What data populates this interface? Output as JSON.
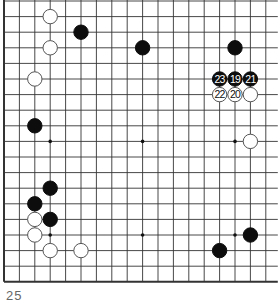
{
  "diagram": {
    "type": "go-board-fragment",
    "caption": "25",
    "grid": {
      "origin_x": 4,
      "origin_y": 1,
      "spacing_x": 15.4,
      "spacing_y": 15.6,
      "cols_visible": 18,
      "rows_visible": 19,
      "left_edge": true,
      "bottom_edge": true,
      "line_color": "#333333"
    },
    "star_points": [
      [
        3,
        3
      ],
      [
        9,
        3
      ],
      [
        15,
        3
      ],
      [
        3,
        9
      ],
      [
        9,
        9
      ],
      [
        15,
        9
      ],
      [
        3,
        15
      ],
      [
        9,
        15
      ],
      [
        15,
        15
      ]
    ],
    "stones": [
      {
        "color": "white",
        "col": 3,
        "row": 1,
        "label": ""
      },
      {
        "color": "black",
        "col": 5,
        "row": 2,
        "label": ""
      },
      {
        "color": "white",
        "col": 3,
        "row": 3,
        "label": ""
      },
      {
        "color": "black",
        "col": 9,
        "row": 3,
        "label": ""
      },
      {
        "color": "black",
        "col": 15,
        "row": 3,
        "label": ""
      },
      {
        "color": "white",
        "col": 2,
        "row": 5,
        "label": ""
      },
      {
        "color": "black",
        "col": 14,
        "row": 5,
        "label": "23"
      },
      {
        "color": "black",
        "col": 15,
        "row": 5,
        "label": "19"
      },
      {
        "color": "black",
        "col": 16,
        "row": 5,
        "label": "21"
      },
      {
        "color": "white",
        "col": 14,
        "row": 6,
        "label": "22"
      },
      {
        "color": "white",
        "col": 15,
        "row": 6,
        "label": "20"
      },
      {
        "color": "white",
        "col": 16,
        "row": 6,
        "label": ""
      },
      {
        "color": "black",
        "col": 2,
        "row": 8,
        "label": ""
      },
      {
        "color": "white",
        "col": 16,
        "row": 9,
        "label": ""
      },
      {
        "color": "black",
        "col": 3,
        "row": 12,
        "label": ""
      },
      {
        "color": "black",
        "col": 2,
        "row": 13,
        "label": ""
      },
      {
        "color": "white",
        "col": 2,
        "row": 14,
        "label": ""
      },
      {
        "color": "black",
        "col": 3,
        "row": 14,
        "label": ""
      },
      {
        "color": "white",
        "col": 2,
        "row": 15,
        "label": ""
      },
      {
        "color": "black",
        "col": 16,
        "row": 15,
        "label": ""
      },
      {
        "color": "white",
        "col": 3,
        "row": 16,
        "label": ""
      },
      {
        "color": "white",
        "col": 5,
        "row": 16,
        "label": ""
      },
      {
        "color": "black",
        "col": 14,
        "row": 16,
        "label": ""
      }
    ]
  }
}
